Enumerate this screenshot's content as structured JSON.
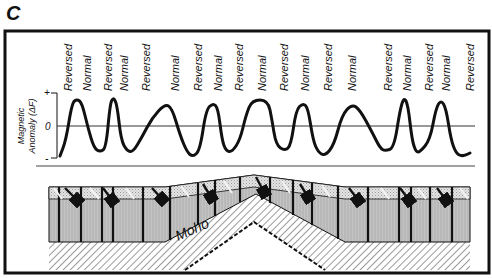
{
  "figure": {
    "panel_letter": "C",
    "axis": {
      "label_line1": "Magnetic",
      "label_line2": "Anomaly (ΔF)",
      "tick_plus": "+",
      "tick_zero": "0",
      "tick_minus": "-"
    },
    "moho_label": "Moho",
    "polarity_labels": [
      {
        "text": "Reversed",
        "x": 68
      },
      {
        "text": "Normal",
        "x": 87
      },
      {
        "text": "Reversed",
        "x": 108
      },
      {
        "text": "Normal",
        "x": 124
      },
      {
        "text": "Reversed",
        "x": 146
      },
      {
        "text": "Normal",
        "x": 175
      },
      {
        "text": "Reversed",
        "x": 198
      },
      {
        "text": "Normal",
        "x": 218
      },
      {
        "text": "Reversed",
        "x": 239
      },
      {
        "text": "Normal",
        "x": 262
      },
      {
        "text": "Reversed",
        "x": 284
      },
      {
        "text": "Normal",
        "x": 305
      },
      {
        "text": "Reversed",
        "x": 328
      },
      {
        "text": "Normal",
        "x": 352
      },
      {
        "text": "Reversed",
        "x": 388
      },
      {
        "text": "Normal",
        "x": 407
      },
      {
        "text": "Reversed",
        "x": 429
      },
      {
        "text": "Normal",
        "x": 446
      },
      {
        "text": "Reversed",
        "x": 470
      }
    ],
    "colors": {
      "frame": "#111111",
      "curve": "#111111",
      "crust_gray": "#b9b9b9",
      "top_layer": "#dcdcdc",
      "hatch": "#555555"
    }
  },
  "anomaly_profile": {
    "description": "Symmetric magnetic anomaly profile across a mid-ocean ridge, alternating normal/reversed polarity stripes",
    "points_px": [
      [
        60,
        156
      ],
      [
        66,
        140
      ],
      [
        72,
        103
      ],
      [
        77,
        99
      ],
      [
        82,
        103
      ],
      [
        88,
        128
      ],
      [
        94,
        148
      ],
      [
        100,
        152
      ],
      [
        106,
        148
      ],
      [
        110,
        105
      ],
      [
        113,
        97
      ],
      [
        117,
        104
      ],
      [
        121,
        140
      ],
      [
        127,
        151
      ],
      [
        133,
        152
      ],
      [
        142,
        137
      ],
      [
        152,
        118
      ],
      [
        165,
        104
      ],
      [
        172,
        108
      ],
      [
        180,
        135
      ],
      [
        187,
        152
      ],
      [
        193,
        157
      ],
      [
        200,
        150
      ],
      [
        206,
        110
      ],
      [
        213,
        103
      ],
      [
        218,
        108
      ],
      [
        222,
        140
      ],
      [
        226,
        151
      ],
      [
        232,
        152
      ],
      [
        240,
        140
      ],
      [
        246,
        115
      ],
      [
        252,
        100
      ],
      [
        268,
        100
      ],
      [
        272,
        120
      ],
      [
        276,
        145
      ],
      [
        285,
        151
      ],
      [
        291,
        145
      ],
      [
        296,
        110
      ],
      [
        303,
        103
      ],
      [
        308,
        108
      ],
      [
        313,
        140
      ],
      [
        318,
        152
      ],
      [
        325,
        156
      ],
      [
        334,
        145
      ],
      [
        342,
        115
      ],
      [
        352,
        104
      ],
      [
        360,
        110
      ],
      [
        372,
        132
      ],
      [
        380,
        148
      ],
      [
        385,
        151
      ],
      [
        394,
        148
      ],
      [
        400,
        110
      ],
      [
        404,
        97
      ],
      [
        408,
        105
      ],
      [
        412,
        140
      ],
      [
        416,
        152
      ],
      [
        420,
        152
      ],
      [
        430,
        140
      ],
      [
        436,
        108
      ],
      [
        441,
        100
      ],
      [
        446,
        108
      ],
      [
        451,
        140
      ],
      [
        456,
        153
      ],
      [
        461,
        156
      ],
      [
        466,
        155
      ],
      [
        470,
        153
      ]
    ]
  }
}
